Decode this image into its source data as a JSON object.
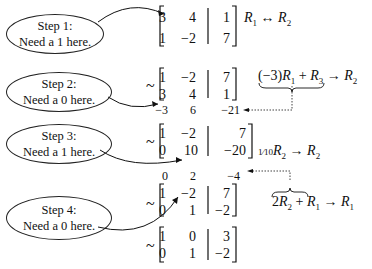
{
  "steps": [
    {
      "title": "Step 1:",
      "note": "Need a 1 here."
    },
    {
      "title": "Step 2:",
      "note": "Need a 0 here."
    },
    {
      "title": "Step 3:",
      "note": "Need a 1 here."
    },
    {
      "title": "Step 4:",
      "note": "Need a 0 here."
    }
  ],
  "matrices": [
    {
      "rows": [
        [
          "3",
          "4",
          "1"
        ],
        [
          "1",
          "−2",
          "7"
        ]
      ],
      "tilde": ""
    },
    {
      "rows": [
        [
          "1",
          "−2",
          "7"
        ],
        [
          "3",
          "4",
          "1"
        ]
      ],
      "tilde": "~",
      "helper_row": [
        "−3",
        "6",
        "−21"
      ]
    },
    {
      "rows": [
        [
          "1",
          "−2",
          "7"
        ],
        [
          "0",
          "10",
          "−20"
        ]
      ],
      "tilde": "~"
    },
    {
      "rows": [
        [
          "1",
          "−2",
          "7"
        ],
        [
          "0",
          "1",
          "−2"
        ]
      ],
      "tilde": "~",
      "helper_row": [
        "0",
        "2",
        "−4"
      ]
    },
    {
      "rows": [
        [
          "1",
          "0",
          "3"
        ],
        [
          "0",
          "1",
          "−2"
        ]
      ],
      "tilde": "~"
    }
  ],
  "operations": [
    {
      "text": "R1 ↔ R2"
    },
    {
      "text": "(−3)R1 + R3 → R2"
    },
    {
      "text": "1/10 R2 → R2"
    },
    {
      "text": "2R2 + R1 → R1"
    }
  ]
}
